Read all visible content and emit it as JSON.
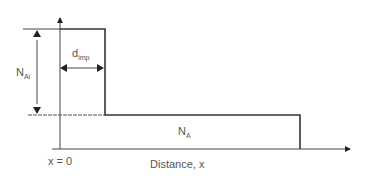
{
  "diagram": {
    "type": "step-doping-profile",
    "labels": {
      "n_ai": {
        "main": "N",
        "sub": "Ai"
      },
      "d_imp": {
        "main": "d",
        "sub": "imp"
      },
      "n_a": {
        "main": "N",
        "sub": "A"
      },
      "x_origin": "x = 0",
      "x_axis": "Distance, x"
    },
    "colors": {
      "line": "#333333",
      "text": "#555555",
      "background": "#ffffff"
    }
  }
}
